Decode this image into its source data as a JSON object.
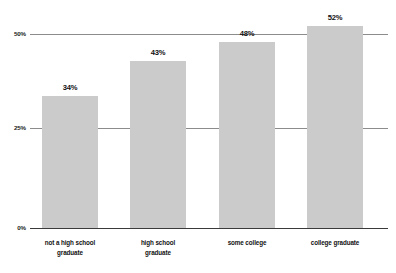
{
  "chart_data": {
    "type": "bar",
    "title": "",
    "subtitle": "",
    "xlabel": "",
    "ylabel": "",
    "categories": [
      "not a high school graduate",
      "high school graduate",
      "some college",
      "college graduate"
    ],
    "category_lines": [
      [
        "not a high school",
        "graduate"
      ],
      [
        "high school",
        "graduate"
      ],
      [
        "some college"
      ],
      [
        "college graduate"
      ]
    ],
    "values": [
      34,
      43,
      48,
      52
    ],
    "value_labels": [
      "34%",
      "43%",
      "48%",
      "52%"
    ],
    "ylim": [
      0,
      50
    ],
    "yticks": [
      0,
      25,
      50
    ],
    "ytick_labels": [
      "0%",
      "25%",
      "50%"
    ],
    "grid": true,
    "grid_axis": "y",
    "legend": false,
    "legend_position": "none",
    "bar_color": "#cbcbcb",
    "gridline_color": "#8c8c8c",
    "axis_color": "#3a3a3a",
    "label_color": "#111111",
    "background": "#ffffff"
  }
}
